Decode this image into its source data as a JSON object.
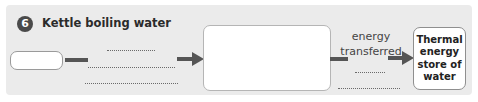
{
  "question": {
    "number": "6",
    "title": "Kettle boiling water"
  },
  "diagram": {
    "start_box": {
      "value": ""
    },
    "answer_lines_left": [
      "",
      "",
      ""
    ],
    "middle_box": {
      "value": ""
    },
    "transfer_label": "energy transferred",
    "answer_lines_right": [
      "",
      ""
    ],
    "end_store": "Thermal energy store of water"
  },
  "colors": {
    "panel_bg": "#ebebeb",
    "badge_bg": "#4a4a4a",
    "arrow": "#555555",
    "box_border": "#9a9a9a"
  },
  "icons": {
    "arrow": "right-arrow"
  }
}
